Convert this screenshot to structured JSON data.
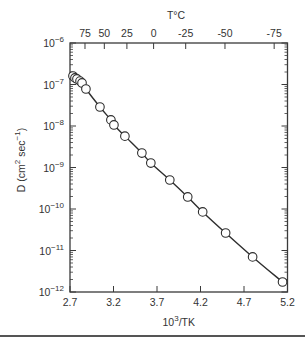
{
  "chart_data": {
    "type": "scatter",
    "title": "",
    "xlabel": "10^3/TK",
    "ylabel": "D (cm^2 sec^-1)",
    "top_axis_label": "T°C",
    "xlim": [
      2.7,
      5.2
    ],
    "ylim": [
      1e-12,
      1e-06
    ],
    "y_scale": "log",
    "grid": false,
    "legend": null,
    "x_ticks": [
      2.7,
      3.2,
      3.7,
      4.2,
      4.7,
      5.2
    ],
    "x_tick_labels": [
      "2.7",
      "3.2",
      "3.7",
      "4.2",
      "4.7",
      "5.2"
    ],
    "y_ticks": [
      1e-06,
      1e-07,
      1e-08,
      1e-09,
      1e-10,
      1e-11,
      1e-12
    ],
    "y_tick_labels": [
      {
        "base": "10",
        "exp": "−6"
      },
      {
        "base": "10",
        "exp": "−7"
      },
      {
        "base": "10",
        "exp": "−8"
      },
      {
        "base": "10",
        "exp": "−9"
      },
      {
        "base": "10",
        "exp": "−10"
      },
      {
        "base": "10",
        "exp": "−11"
      },
      {
        "base": "10",
        "exp": "−12"
      }
    ],
    "top_ticks_celsius": [
      75,
      50,
      25,
      0,
      -25,
      -50,
      -75
    ],
    "top_tick_labels": [
      "75",
      "50",
      "25",
      "0",
      "-25",
      "-50",
      "-75"
    ],
    "series": [
      {
        "name": "D",
        "marker": "open-circle",
        "line": "solid",
        "x": [
          2.734,
          2.757,
          2.78,
          2.815,
          2.838,
          2.883,
          3.044,
          3.17,
          3.205,
          3.331,
          3.526,
          3.629,
          3.847,
          4.053,
          4.225,
          4.489,
          4.799,
          5.143
        ],
        "y": [
          1.6e-07,
          1.44e-07,
          1.36e-07,
          1.21e-07,
          1.09e-07,
          7.8e-08,
          2.87e-08,
          1.4e-08,
          1.06e-08,
          5.7e-09,
          2.23e-09,
          1.28e-09,
          5e-10,
          1.95e-10,
          8.5e-11,
          2.64e-11,
          7e-12,
          1.74e-12
        ]
      }
    ]
  }
}
